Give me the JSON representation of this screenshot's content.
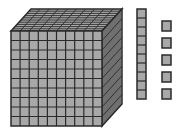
{
  "diagram": {
    "blocks": [
      {
        "name": "thousand-cube",
        "value": 1000,
        "grid": [
          10,
          10,
          10
        ]
      },
      {
        "name": "ten-rod",
        "value": 10,
        "count": 1
      },
      {
        "name": "unit-cube",
        "value": 1,
        "count": 5
      }
    ],
    "colors": {
      "fill": "#a8a8a8",
      "line": "#2a2a2a",
      "bg": "#ffffff"
    }
  }
}
